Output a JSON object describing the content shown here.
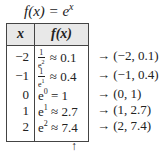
{
  "title": {
    "lhs": "f(x) = e",
    "exp": "x"
  },
  "table": {
    "headers": [
      "x",
      "f(x)"
    ],
    "rows": [
      {
        "x": "−2",
        "f_type": "frac",
        "num": "1",
        "den_base": "e",
        "den_exp": "2",
        "approx": "≈ 0.1",
        "point": "→ (−2, 0.1)"
      },
      {
        "x": "−1",
        "f_type": "frac",
        "num": "1",
        "den_base": "e",
        "den_exp": "1",
        "approx": "≈ 0.4",
        "point": "→ (−1, 0.4)"
      },
      {
        "x": "0",
        "f_type": "pow",
        "base": "e",
        "exp": "0",
        "approx": "= 1",
        "point": "→ (0, 1)"
      },
      {
        "x": "1",
        "f_type": "pow",
        "base": "e",
        "exp": "1",
        "approx": "≈ 2.7",
        "point": "→ (1, 2.7)"
      },
      {
        "x": "2",
        "f_type": "pow",
        "base": "e",
        "exp": "2",
        "approx": "≈ 7.4",
        "point": "→ (2, 7.4)"
      }
    ]
  },
  "footer_arrow": "↑"
}
